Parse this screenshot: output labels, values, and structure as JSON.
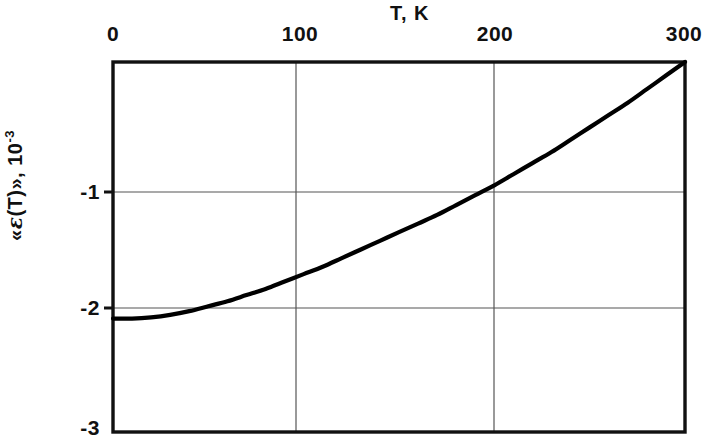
{
  "chart_data": {
    "type": "line",
    "title": "",
    "xlabel": "T, K",
    "ylabel": "«ε(T)», 10-3",
    "ylabel_parts": {
      "prefix": "«",
      "symbol": "ε",
      "argument": "(T)",
      "suffix": "»,",
      "unit_mantissa": "10",
      "unit_exponent": "-3"
    },
    "xlim": [
      0,
      300
    ],
    "ylim": [
      -3,
      0
    ],
    "xticks": [
      0,
      100,
      200,
      300
    ],
    "xtick_labels": [
      "0",
      "100",
      "200",
      "300"
    ],
    "yticks": [
      -1,
      -2,
      -3
    ],
    "ytick_labels": [
      "-1",
      "-2",
      "-3"
    ],
    "grid": true,
    "grid_x_values": [
      100,
      200
    ],
    "grid_y_values": [
      -1,
      -2
    ],
    "legend": null,
    "legend_position": "none",
    "series": [
      {
        "name": "«ε(T)»",
        "color": "#000000",
        "x": [
          0,
          10,
          20,
          30,
          40,
          50,
          60,
          70,
          80,
          90,
          100,
          110,
          120,
          130,
          140,
          150,
          160,
          170,
          180,
          190,
          200,
          210,
          220,
          230,
          240,
          250,
          260,
          270,
          280,
          290,
          300
        ],
        "values": [
          -2.08,
          -2.08,
          -2.07,
          -2.05,
          -2.02,
          -1.98,
          -1.94,
          -1.89,
          -1.84,
          -1.78,
          -1.72,
          -1.66,
          -1.59,
          -1.52,
          -1.45,
          -1.38,
          -1.31,
          -1.24,
          -1.16,
          -1.08,
          -1.0,
          -0.91,
          -0.82,
          -0.73,
          -0.63,
          -0.53,
          -0.43,
          -0.33,
          -0.22,
          -0.11,
          0.0
        ]
      }
    ],
    "annotations": [
      {
        "text": "curve starts at -2.08 at T=0",
        "visible": false
      }
    ]
  },
  "axis_titles": {
    "x": "T, K"
  },
  "style": {
    "frame_color": "#111111",
    "grid_color": "#555555",
    "curve_color": "#000000",
    "background": "#ffffff"
  }
}
